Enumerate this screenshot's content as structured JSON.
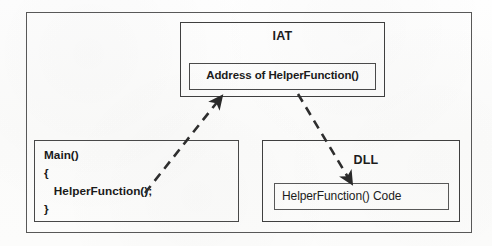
{
  "diagram": {
    "title_semantic": "iat-dll-call-resolution",
    "background_color": "#fdfdfc",
    "stroke_color": "#3f3f3f",
    "text_color": "#1c1c1c"
  },
  "iat": {
    "title": "IAT",
    "entry_label": "Address of HelperFunction()"
  },
  "main_program": {
    "code_lines": [
      "Main()",
      "{",
      "   HelperFunction();",
      "}"
    ],
    "line_0": "Main()",
    "line_1": "{",
    "line_2": "   HelperFunction();",
    "line_3": "}"
  },
  "dll": {
    "title": "DLL",
    "code_label": "HelperFunction() Code"
  },
  "arrows": [
    {
      "name": "main-to-iat-arrow",
      "from": "HelperFunction(); call site in Main()",
      "to": "Address of HelperFunction() entry in IAT",
      "style": "dashed",
      "direction": "up-right"
    },
    {
      "name": "iat-to-dll-arrow",
      "from": "Address of HelperFunction() entry in IAT",
      "to": "HelperFunction() Code in DLL",
      "style": "dashed",
      "direction": "down-right"
    }
  ]
}
